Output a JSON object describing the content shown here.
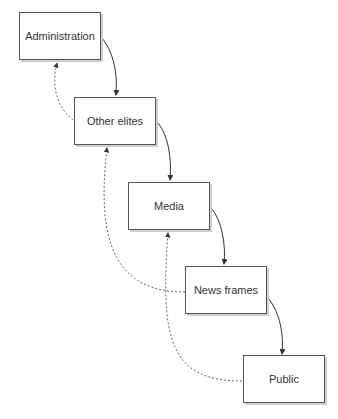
{
  "diagram": {
    "nodes": [
      {
        "id": "administration",
        "label": "Administration"
      },
      {
        "id": "other-elites",
        "label": "Other elites"
      },
      {
        "id": "media",
        "label": "Media"
      },
      {
        "id": "news-frames",
        "label": "News frames"
      },
      {
        "id": "public",
        "label": "Public"
      }
    ],
    "edges": [
      {
        "from": "administration",
        "to": "other-elites",
        "style": "solid"
      },
      {
        "from": "other-elites",
        "to": "media",
        "style": "solid"
      },
      {
        "from": "media",
        "to": "news-frames",
        "style": "solid"
      },
      {
        "from": "news-frames",
        "to": "public",
        "style": "solid"
      },
      {
        "from": "other-elites",
        "to": "administration",
        "style": "dashed"
      },
      {
        "from": "news-frames",
        "to": "other-elites",
        "style": "dashed"
      },
      {
        "from": "public",
        "to": "media",
        "style": "dashed"
      }
    ]
  }
}
